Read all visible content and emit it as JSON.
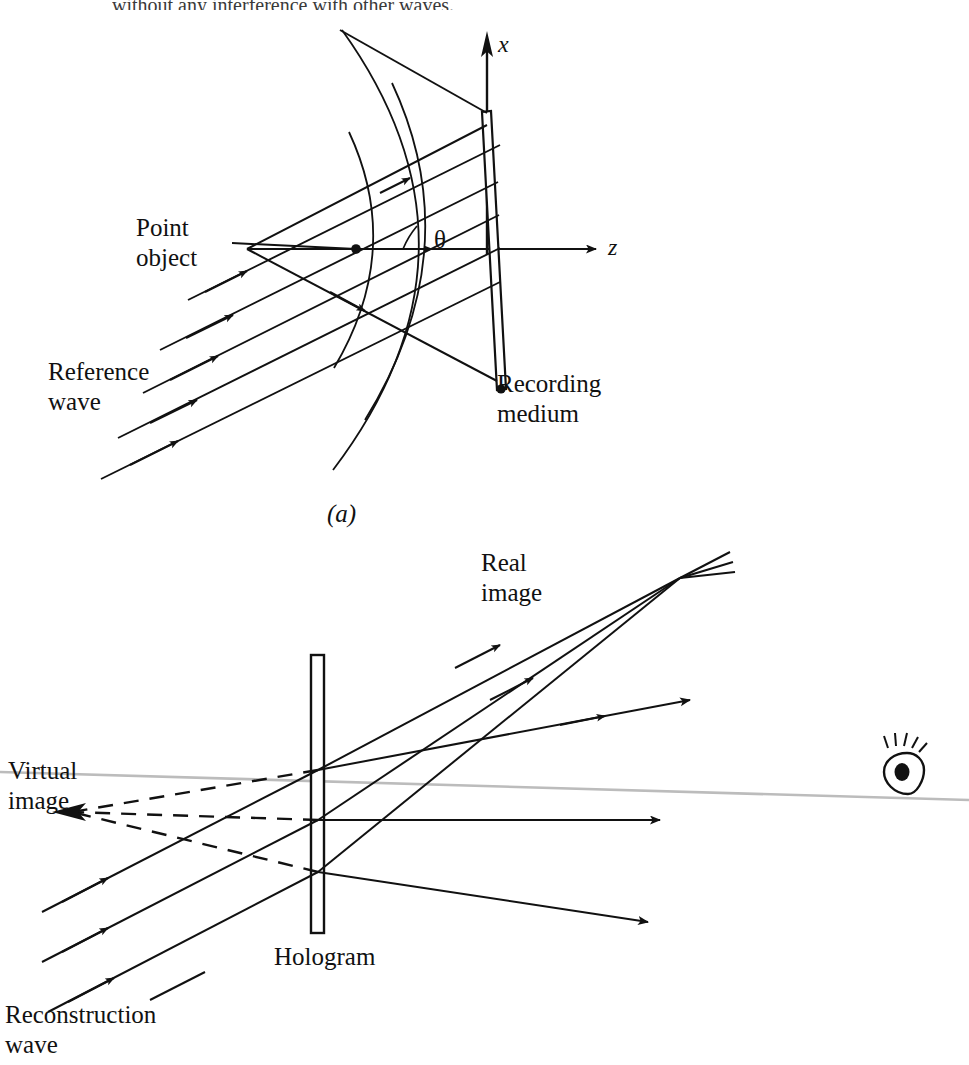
{
  "figure": {
    "title_fragment": "without any interference with other waves.",
    "panels": [
      {
        "id": "a",
        "caption": "(a)",
        "labels": {
          "point_object": "Point\nobject",
          "reference_wave": "Reference\nwave",
          "recording_medium": "Recording\nmedium",
          "angle_symbol": "θ",
          "axis_x": "x",
          "axis_z": "z"
        }
      },
      {
        "id": "b",
        "caption": "",
        "labels": {
          "real_image": "Real\nimage",
          "virtual_image": "Virtual\nimage",
          "hologram": "Hologram",
          "reconstruction_wave": "Reconstruction\nwave",
          "observer": "eye-icon"
        }
      }
    ],
    "colors": {
      "ink": "#111111",
      "paper": "#ffffff",
      "axis_gray": "#b9b9b9"
    }
  },
  "labels_flat": {
    "point_object_1": "Point",
    "point_object_2": "object",
    "reference_1": "Reference",
    "reference_2": "wave",
    "recording_1": "Recording",
    "recording_2": "medium",
    "theta": "θ",
    "x_axis": "x",
    "z_axis": "z",
    "caption_a": "(a)",
    "real_1": "Real",
    "real_2": "image",
    "virtual_1": "Virtual",
    "virtual_2": "image",
    "hologram": "Hologram",
    "reconstruction_1": "Reconstruction",
    "reconstruction_2": "wave",
    "header_text": "without any interference with other waves."
  }
}
